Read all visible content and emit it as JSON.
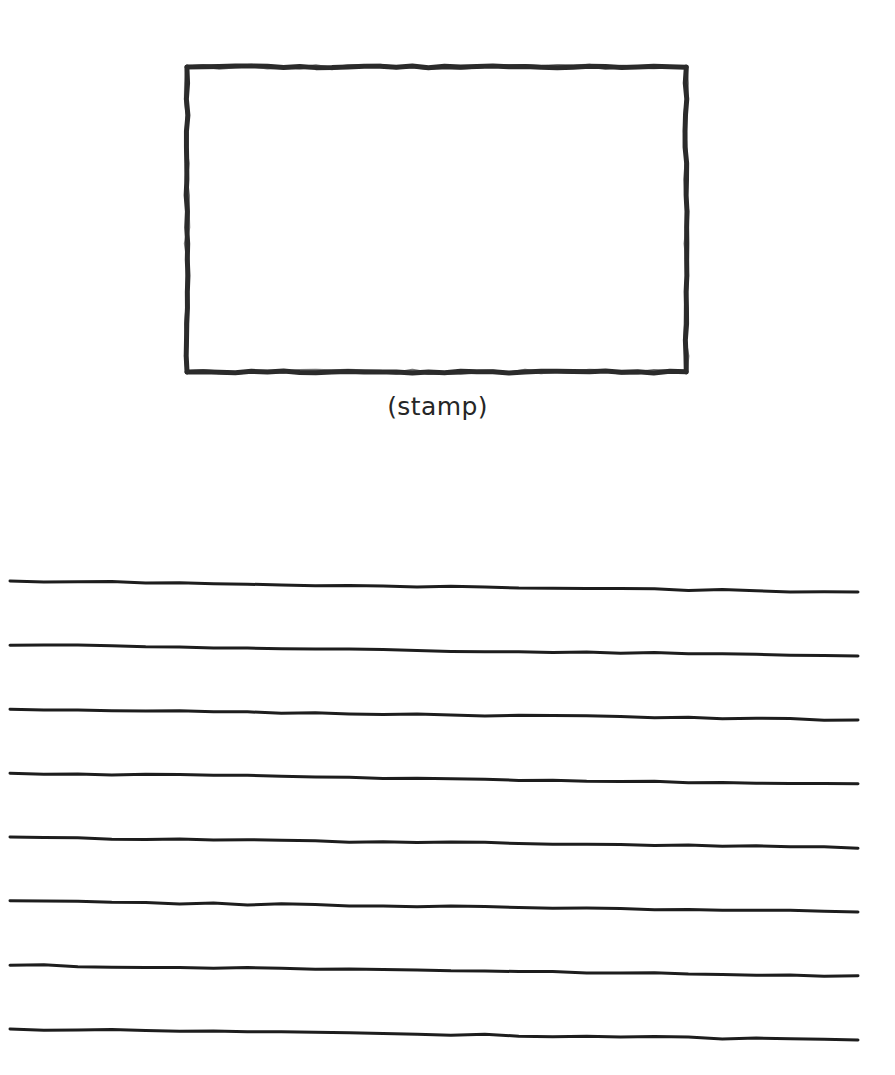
{
  "page": {
    "width": 895,
    "height": 1075,
    "background_color": "#ffffff",
    "ink_color": "#262626"
  },
  "stamp_box": {
    "name": "stamp placeholder box",
    "caption": "(stamp)",
    "x": 187,
    "y": 67,
    "width": 499,
    "height": 305,
    "stroke_width": 5,
    "stroke_color": "#2b2b2b",
    "fill": "#ffffff",
    "style": "hand-drawn"
  },
  "writing_lines": {
    "name": "ruled writing lines",
    "count": 8,
    "x_start": 10,
    "x_end": 858,
    "stroke_width": 3,
    "stroke_color": "#1d1d1d",
    "spacing": 64,
    "slope_drop": 11,
    "style": "hand-drawn",
    "left_y": [
      581,
      645,
      709,
      773,
      837,
      901,
      965,
      1029
    ]
  }
}
